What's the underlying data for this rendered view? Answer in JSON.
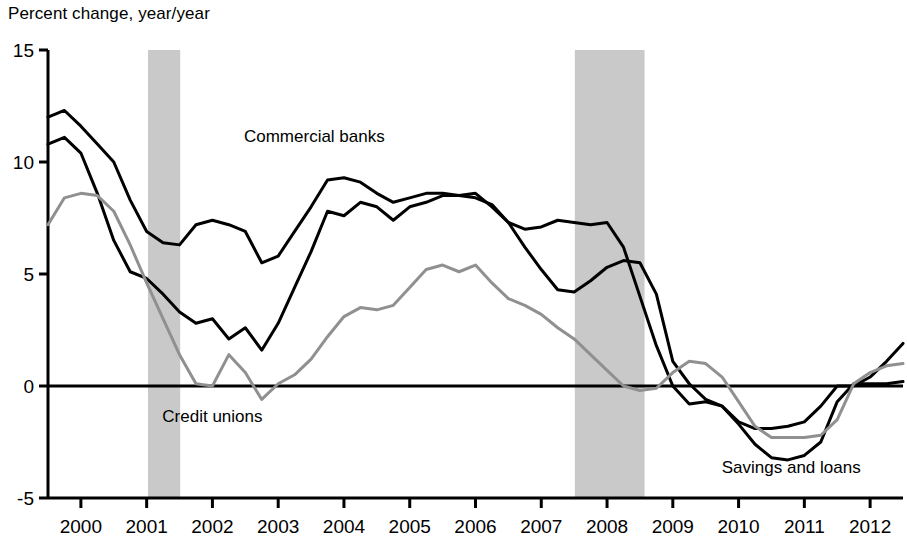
{
  "header": {
    "title": "Percent change, year/year"
  },
  "chart_data": {
    "type": "line",
    "title": "Percent change, year/year",
    "xlabel": "",
    "ylabel": "Percent change, year/year",
    "ylim": [
      -5,
      15
    ],
    "xlim": [
      1999.5,
      2012.5
    ],
    "yticks": [
      -5,
      0,
      5,
      10,
      15
    ],
    "ytick_labels": [
      "-5",
      "0",
      "5",
      "10",
      "15"
    ],
    "xticks": [
      2000,
      2001,
      2002,
      2003,
      2004,
      2005,
      2006,
      2007,
      2008,
      2009,
      2010,
      2011,
      2012
    ],
    "xtick_labels": [
      "2000",
      "2001",
      "2002",
      "2003",
      "2004",
      "2005",
      "2006",
      "2007",
      "2008",
      "2009",
      "2010",
      "2011",
      "2012"
    ],
    "grid": false,
    "legend": "inline-annotations",
    "zero_line": true,
    "shaded_bands": [
      {
        "name": "recession-2001",
        "x0": 2001.02,
        "x1": 2001.51,
        "color": "#c9c9c9"
      },
      {
        "name": "recession-2008",
        "x0": 2007.51,
        "x1": 2008.57,
        "color": "#c9c9c9"
      }
    ],
    "series": [
      {
        "name": "Commercial banks",
        "color": "#000000",
        "width": 3.0,
        "label_x": 2003.55,
        "label_y": 10.9,
        "x": [
          1999.5,
          1999.75,
          2000.0,
          2000.25,
          2000.5,
          2000.75,
          2001.0,
          2001.25,
          2001.5,
          2001.75,
          2002.0,
          2002.25,
          2002.5,
          2002.75,
          2003.0,
          2003.25,
          2003.5,
          2003.75,
          2004.0,
          2004.25,
          2004.5,
          2004.75,
          2005.0,
          2005.25,
          2005.5,
          2005.75,
          2006.0,
          2006.25,
          2006.5,
          2006.75,
          2007.0,
          2007.25,
          2007.5,
          2007.75,
          2008.0,
          2008.25,
          2008.5,
          2008.75,
          2009.0,
          2009.25,
          2009.5,
          2009.75,
          2010.0,
          2010.25,
          2010.5,
          2010.75,
          2011.0,
          2011.25,
          2011.5,
          2011.75,
          2012.0,
          2012.25,
          2012.5
        ],
        "y": [
          12.0,
          12.3,
          11.6,
          10.8,
          10.0,
          8.3,
          6.9,
          6.4,
          6.3,
          7.2,
          7.4,
          7.2,
          6.9,
          5.5,
          5.8,
          6.9,
          8.0,
          9.2,
          9.3,
          9.1,
          8.6,
          8.2,
          8.4,
          8.6,
          8.6,
          8.5,
          8.6,
          8.0,
          7.3,
          7.0,
          7.1,
          7.4,
          7.3,
          7.2,
          7.3,
          6.2,
          4.0,
          1.8,
          0.0,
          -0.8,
          -0.7,
          -0.9,
          -1.6,
          -1.9,
          -1.9,
          -1.8,
          -1.6,
          -0.9,
          0.0,
          0.0,
          0.4,
          1.1,
          1.9
        ]
      },
      {
        "name": "Credit unions",
        "color": "#000000",
        "width": 3.0,
        "label_x": 2002.0,
        "label_y": -1.6,
        "x": [
          1999.5,
          1999.75,
          2000.0,
          2000.25,
          2000.5,
          2000.75,
          2001.0,
          2001.25,
          2001.5,
          2001.75,
          2002.0,
          2002.25,
          2002.5,
          2002.75,
          2003.0,
          2003.25,
          2003.5,
          2003.75,
          2004.0,
          2004.25,
          2004.5,
          2004.75,
          2005.0,
          2005.25,
          2005.5,
          2005.75,
          2006.0,
          2006.25,
          2006.5,
          2006.75,
          2007.0,
          2007.25,
          2007.5,
          2007.75,
          2008.0,
          2008.25,
          2008.5,
          2008.75,
          2009.0,
          2009.25,
          2009.5,
          2009.75,
          2010.0,
          2010.25,
          2010.5,
          2010.75,
          2011.0,
          2011.25,
          2011.5,
          2011.75,
          2012.0,
          2012.25,
          2012.5
        ],
        "y": [
          10.8,
          11.1,
          10.4,
          8.6,
          6.5,
          5.1,
          4.8,
          4.1,
          3.3,
          2.8,
          3.0,
          2.1,
          2.6,
          1.6,
          2.8,
          4.4,
          6.0,
          7.8,
          7.6,
          8.2,
          8.0,
          7.4,
          8.0,
          8.2,
          8.5,
          8.5,
          8.4,
          8.1,
          7.3,
          6.2,
          5.2,
          4.3,
          4.2,
          4.7,
          5.3,
          5.6,
          5.5,
          4.1,
          1.1,
          0.1,
          -0.6,
          -0.9,
          -1.7,
          -2.6,
          -3.2,
          -3.3,
          -3.1,
          -2.5,
          -0.7,
          0.1,
          0.1,
          0.1,
          0.2
        ]
      },
      {
        "name": "Savings and loans",
        "color": "#909090",
        "width": 3.0,
        "label_x": 2010.8,
        "label_y": -3.9,
        "x": [
          1999.5,
          1999.75,
          2000.0,
          2000.25,
          2000.5,
          2000.75,
          2001.0,
          2001.25,
          2001.5,
          2001.75,
          2002.0,
          2002.25,
          2002.5,
          2002.75,
          2003.0,
          2003.25,
          2003.5,
          2003.75,
          2004.0,
          2004.25,
          2004.5,
          2004.75,
          2005.0,
          2005.25,
          2005.5,
          2005.75,
          2006.0,
          2006.25,
          2006.5,
          2006.75,
          2007.0,
          2007.25,
          2007.5,
          2007.75,
          2008.0,
          2008.25,
          2008.5,
          2008.75,
          2009.0,
          2009.25,
          2009.5,
          2009.75,
          2010.0,
          2010.25,
          2010.5,
          2010.75,
          2011.0,
          2011.25,
          2011.5,
          2011.75,
          2012.0,
          2012.25,
          2012.5
        ],
        "y": [
          7.2,
          8.4,
          8.6,
          8.5,
          7.8,
          6.3,
          4.6,
          3.0,
          1.4,
          0.1,
          0.0,
          1.4,
          0.6,
          -0.6,
          0.1,
          0.5,
          1.2,
          2.2,
          3.1,
          3.5,
          3.4,
          3.6,
          4.4,
          5.2,
          5.4,
          5.1,
          5.4,
          4.6,
          3.9,
          3.6,
          3.2,
          2.6,
          2.1,
          1.4,
          0.7,
          0.0,
          -0.2,
          -0.1,
          0.6,
          1.1,
          1.0,
          0.4,
          -0.7,
          -1.8,
          -2.3,
          -2.3,
          -2.3,
          -2.2,
          -1.5,
          0.1,
          0.6,
          0.9,
          1.0
        ]
      }
    ]
  }
}
